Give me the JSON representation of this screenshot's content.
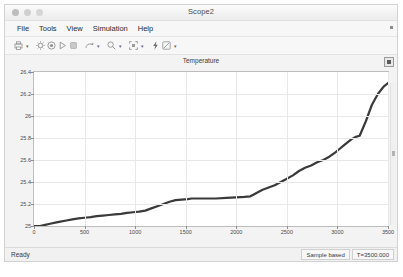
{
  "window": {
    "title": "Scope2",
    "traffic_lights": [
      "close",
      "minimize",
      "zoom"
    ]
  },
  "menubar": {
    "items": [
      {
        "label": "File"
      },
      {
        "label": "Tools"
      },
      {
        "label": "View"
      },
      {
        "label": "Simulation"
      },
      {
        "label": "Help"
      }
    ],
    "overflow_icon": "menu-overflow-icon"
  },
  "toolbar": {
    "groups": [
      {
        "icon": "print-icon",
        "has_caret": true
      },
      {
        "icon": "configuration-properties-icon",
        "has_caret": false
      },
      {
        "icon": "record-icon",
        "has_caret": false
      },
      {
        "icon": "run-icon",
        "has_caret": false
      },
      {
        "icon": "stop-icon",
        "has_caret": false
      },
      {
        "icon": "step-forward-icon",
        "has_caret": true
      },
      {
        "icon": "zoom-icon",
        "has_caret": true
      },
      {
        "icon": "autoscale-icon",
        "has_caret": true
      },
      {
        "icon": "lightning-icon",
        "has_caret": false
      },
      {
        "icon": "cursor-measurements-icon",
        "has_caret": true
      }
    ]
  },
  "plot": {
    "title": "Temperature",
    "expand_icon": "expand-panel-icon"
  },
  "statusbar": {
    "state": "Ready",
    "sample_mode": "Sample based",
    "time": "T=3500.000"
  },
  "chart_data": {
    "type": "line",
    "title": "Temperature",
    "xlabel": "",
    "ylabel": "",
    "xlim": [
      0,
      3500
    ],
    "ylim": [
      25,
      26.4
    ],
    "grid": true,
    "legend": false,
    "xticks": [
      0,
      500,
      1000,
      1500,
      2000,
      2500,
      3000,
      3500
    ],
    "yticks": [
      25,
      25.2,
      25.4,
      25.6,
      25.8,
      26,
      26.2,
      26.4
    ],
    "ytick_labels": [
      "25",
      "25.2",
      "25.4",
      "25.6",
      "25.8",
      "26",
      "26.2",
      "26.4"
    ],
    "xtick_labels": [
      "0",
      "500",
      "1000",
      "1500",
      "2000",
      "2500",
      "3000",
      "3500"
    ],
    "line_color": "#3a3a3a",
    "series": [
      {
        "name": "Temperature",
        "x": [
          0,
          60,
          110,
          160,
          210,
          260,
          320,
          380,
          440,
          500,
          560,
          620,
          680,
          740,
          800,
          860,
          920,
          980,
          1040,
          1100,
          1160,
          1220,
          1280,
          1340,
          1400,
          1460,
          1520,
          1560,
          1620,
          1700,
          1800,
          1900,
          2000,
          2080,
          2140,
          2200,
          2260,
          2320,
          2380,
          2440,
          2500,
          2560,
          2620,
          2680,
          2740,
          2800,
          2860,
          2920,
          2980,
          3020,
          3060,
          3100,
          3140,
          3180,
          3220,
          3280,
          3340,
          3400,
          3460,
          3500
        ],
        "y": [
          25.0,
          25.0,
          25.01,
          25.02,
          25.03,
          25.04,
          25.05,
          25.06,
          25.07,
          25.075,
          25.08,
          25.09,
          25.095,
          25.1,
          25.105,
          25.11,
          25.12,
          25.125,
          25.13,
          25.14,
          25.16,
          25.18,
          25.2,
          25.22,
          25.235,
          25.24,
          25.245,
          25.25,
          25.25,
          25.25,
          25.25,
          25.255,
          25.26,
          25.265,
          25.27,
          25.3,
          25.33,
          25.35,
          25.37,
          25.4,
          25.43,
          25.46,
          25.5,
          25.53,
          25.55,
          25.58,
          25.6,
          25.63,
          25.67,
          25.7,
          25.73,
          25.76,
          25.79,
          25.81,
          25.82,
          25.95,
          26.1,
          26.2,
          26.27,
          26.3
        ]
      }
    ]
  }
}
